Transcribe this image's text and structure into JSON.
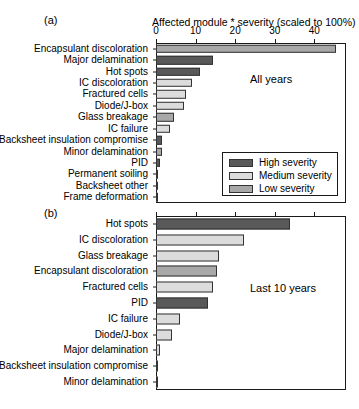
{
  "figure": {
    "axis_title": "Affected module * severity (scaled to 100%)",
    "panel_a_label": "(a)",
    "panel_b_label": "(b)",
    "panel_a_note": "All years",
    "panel_b_note": "Last 10 years"
  },
  "legend": {
    "items": [
      {
        "label": "High severity",
        "color": "#595959"
      },
      {
        "label": "Medium severity",
        "color": "#dcdcdc"
      },
      {
        "label": "Low severity",
        "color": "#a8a8a8"
      }
    ]
  },
  "colors": {
    "high": "#595959",
    "medium": "#dcdcdc",
    "low": "#a8a8a8",
    "axis": "#1a1a1a"
  },
  "chart_data": [
    {
      "type": "bar",
      "orientation": "horizontal",
      "panel": "(a)",
      "title": "All years",
      "xlabel": "Affected module * severity (scaled to 100%)",
      "ylabel": "",
      "xlim": [
        0,
        48
      ],
      "xticks": [
        0,
        10,
        20,
        30,
        40
      ],
      "grid": false,
      "legend": [
        "High severity",
        "Medium severity",
        "Low severity"
      ],
      "legend_position": "inside-lower-right",
      "categories": [
        "Encapsulant discoloration",
        "Major delamination",
        "Hot spots",
        "IC discoloration",
        "Fractured cells",
        "Diode/J-box",
        "Glass breakage",
        "IC failure",
        "Backsheet insulation compromise",
        "Minor delamination",
        "PID",
        "Permanent soiling",
        "Backsheet other",
        "Frame deformation"
      ],
      "values": [
        45.5,
        14.5,
        11.0,
        9.0,
        7.5,
        7.0,
        4.5,
        3.5,
        1.6,
        1.5,
        1.0,
        0.4,
        0.3,
        0.3
      ],
      "severity": [
        "low",
        "high",
        "high",
        "medium",
        "medium",
        "medium",
        "low",
        "medium",
        "high",
        "low",
        "high",
        "medium",
        "low",
        "medium"
      ]
    },
    {
      "type": "bar",
      "orientation": "horizontal",
      "panel": "(b)",
      "title": "Last 10 years",
      "xlabel": "Affected module * severity (scaled to 100%)",
      "ylabel": "",
      "xlim": [
        0,
        48
      ],
      "xticks": [
        0,
        10,
        20,
        30,
        40
      ],
      "grid": false,
      "categories": [
        "Hot spots",
        "IC discoloration",
        "Glass breakage",
        "Encapsulant discoloration",
        "Fractured cells",
        "PID",
        "IC failure",
        "Diode/J-box",
        "Major delamination",
        "Backsheet insulation compromise",
        "Minor delamination"
      ],
      "values": [
        33.8,
        22.3,
        16.0,
        15.3,
        14.3,
        13.2,
        6.0,
        4.0,
        1.0,
        0.3,
        0.2
      ],
      "severity": [
        "high",
        "medium",
        "medium",
        "low",
        "medium",
        "high",
        "medium",
        "medium",
        "medium",
        "medium",
        "medium"
      ]
    }
  ]
}
